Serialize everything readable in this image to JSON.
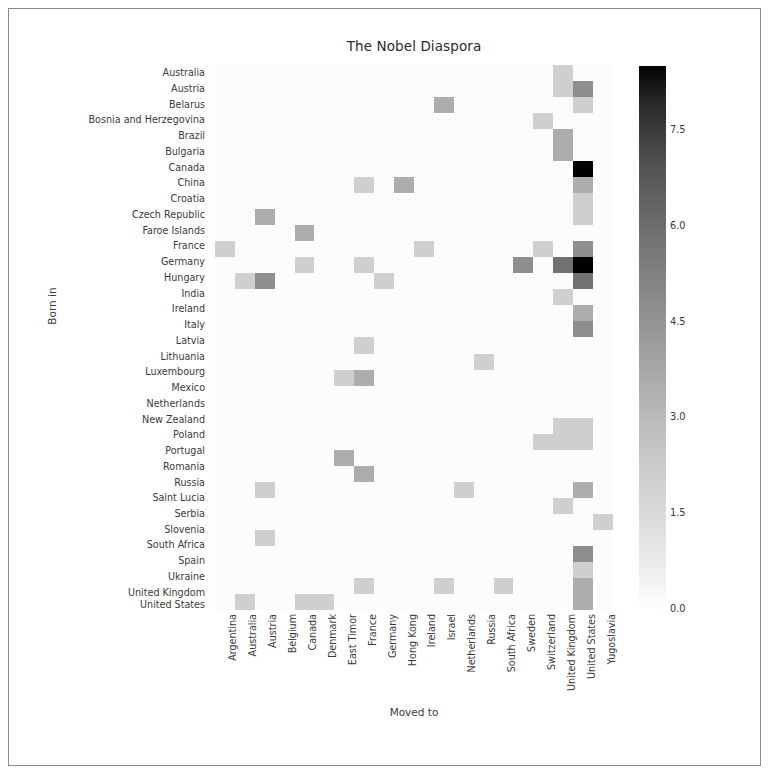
{
  "figure": {
    "title": "The Nobel Diaspora",
    "xlabel": "Moved to",
    "ylabel": "Born in"
  },
  "colorbar": {
    "ticks": [
      "0.0",
      "1.5",
      "3.0",
      "4.5",
      "6.0",
      "7.5"
    ],
    "tick_values": [
      0.0,
      1.5,
      3.0,
      4.5,
      6.0,
      7.5
    ],
    "vmin": 0,
    "vmax": 8.5,
    "low_color": "#ffffff",
    "high_color": "#000000"
  },
  "chart_data": {
    "type": "heatmap",
    "title": "The Nobel Diaspora",
    "xlabel": "Moved to",
    "ylabel": "Born in",
    "grid": false,
    "legend_position": "right",
    "colormap": "Greys",
    "zlim": [
      0,
      8.5
    ],
    "x_categories": [
      "Argentina",
      "Australia",
      "Austria",
      "Belgium",
      "Canada",
      "Denmark",
      "East Timor",
      "France",
      "Germany",
      "Hong Kong",
      "Ireland",
      "Israel",
      "Netherlands",
      "Russia",
      "South Africa",
      "Sweden",
      "Switzerland",
      "United Kingdom",
      "United States",
      "Yugoslavia"
    ],
    "y_categories": [
      "Australia",
      "Austria",
      "Belarus",
      "Bosnia and Herzegovina",
      "Brazil",
      "Bulgaria",
      "Canada",
      "China",
      "Croatia",
      "Czech Republic",
      "Faroe Islands",
      "France",
      "Germany",
      "Hungary",
      "India",
      "Ireland",
      "Italy",
      "Latvia",
      "Lithuania",
      "Luxembourg",
      "Mexico",
      "Netherlands",
      "New Zealand",
      "Poland",
      "Portugal",
      "Romania",
      "Russia",
      "Saint Lucia",
      "Serbia",
      "Slovenia",
      "South Africa",
      "Spain",
      "Ukraine",
      "United Kingdom",
      "United States"
    ],
    "values": [
      [
        0,
        0,
        0,
        0,
        0,
        0,
        0,
        0,
        0,
        0,
        0,
        0,
        0,
        0,
        0,
        0,
        0,
        1,
        0,
        0
      ],
      [
        0,
        0,
        0,
        0,
        0,
        0,
        0,
        0,
        0,
        0,
        0,
        0,
        0,
        0,
        0,
        0,
        0,
        1,
        3,
        0
      ],
      [
        0,
        0,
        0,
        0,
        0,
        0,
        0,
        0,
        0,
        0,
        0,
        2,
        0,
        0,
        0,
        0,
        0,
        0,
        1,
        0
      ],
      [
        0,
        0,
        0,
        0,
        0,
        0,
        0,
        0,
        0,
        0,
        0,
        0,
        0,
        0,
        0,
        0,
        1,
        0,
        0,
        0
      ],
      [
        0,
        0,
        0,
        0,
        0,
        0,
        0,
        0,
        0,
        0,
        0,
        0,
        0,
        0,
        0,
        0,
        0,
        2,
        0,
        0
      ],
      [
        0,
        0,
        0,
        0,
        0,
        0,
        0,
        0,
        0,
        0,
        0,
        0,
        0,
        0,
        0,
        0,
        0,
        2,
        0,
        0
      ],
      [
        0,
        0,
        0,
        0,
        0,
        0,
        0,
        0,
        0,
        0,
        0,
        0,
        0,
        0,
        0,
        0,
        0,
        0,
        8.5,
        0
      ],
      [
        0,
        0,
        0,
        0,
        0,
        0,
        0,
        1,
        0,
        2,
        0,
        0,
        0,
        0,
        0,
        0,
        0,
        0,
        2,
        0
      ],
      [
        0,
        0,
        0,
        0,
        0,
        0,
        0,
        0,
        0,
        0,
        0,
        0,
        0,
        0,
        0,
        0,
        0,
        0,
        1,
        0
      ],
      [
        0,
        0,
        2,
        0,
        0,
        0,
        0,
        0,
        0,
        0,
        0,
        0,
        0,
        0,
        0,
        0,
        0,
        0,
        1,
        0
      ],
      [
        0,
        0,
        0,
        0,
        2,
        0,
        0,
        0,
        0,
        0,
        0,
        0,
        0,
        0,
        0,
        0,
        0,
        0,
        0,
        0
      ],
      [
        1,
        0,
        0,
        0,
        0,
        0,
        0,
        0,
        0,
        0,
        1,
        0,
        0,
        0,
        0,
        0,
        1,
        0,
        3,
        0
      ],
      [
        0,
        0,
        0,
        0,
        1,
        0,
        0,
        1,
        0,
        0,
        0,
        0,
        0,
        0,
        0,
        3,
        0,
        4,
        8.5,
        0
      ],
      [
        0,
        1,
        3,
        0,
        0,
        0,
        0,
        0,
        1,
        0,
        0,
        0,
        0,
        0,
        0,
        0,
        0,
        0,
        4,
        0
      ],
      [
        0,
        0,
        0,
        0,
        0,
        0,
        0,
        0,
        0,
        0,
        0,
        0,
        0,
        0,
        0,
        0,
        0,
        1,
        0,
        0
      ],
      [
        0,
        0,
        0,
        0,
        0,
        0,
        0,
        0,
        0,
        0,
        0,
        0,
        0,
        0,
        0,
        0,
        0,
        0,
        2,
        0
      ],
      [
        0,
        0,
        0,
        0,
        0,
        0,
        0,
        0,
        0,
        0,
        0,
        0,
        0,
        0,
        0,
        0,
        0,
        0,
        3,
        0
      ],
      [
        0,
        0,
        0,
        0,
        0,
        0,
        0,
        1,
        0,
        0,
        0,
        0,
        0,
        0,
        0,
        0,
        0,
        0,
        0,
        0
      ],
      [
        0,
        0,
        0,
        0,
        0,
        0,
        0,
        0,
        0,
        0,
        0,
        0,
        0,
        1,
        0,
        0,
        0,
        0,
        0,
        0
      ],
      [
        0,
        0,
        0,
        0,
        0,
        0,
        1,
        2,
        0,
        0,
        0,
        0,
        0,
        0,
        0,
        0,
        0,
        0,
        0,
        0
      ],
      [
        0,
        0,
        0,
        0,
        0,
        0,
        0,
        0,
        0,
        0,
        0,
        0,
        0,
        0,
        0,
        0,
        0,
        0,
        0,
        0
      ],
      [
        0,
        0,
        0,
        0,
        0,
        0,
        0,
        0,
        0,
        0,
        0,
        0,
        0,
        0,
        0,
        0,
        0,
        0,
        0,
        0
      ],
      [
        0,
        0,
        0,
        0,
        0,
        0,
        0,
        0,
        0,
        0,
        0,
        0,
        0,
        0,
        0,
        0,
        0,
        1,
        1,
        0
      ],
      [
        0,
        0,
        0,
        0,
        0,
        0,
        0,
        0,
        0,
        0,
        0,
        0,
        0,
        0,
        0,
        0,
        1,
        1,
        1,
        0
      ],
      [
        0,
        0,
        0,
        0,
        0,
        0,
        2,
        0,
        0,
        0,
        0,
        0,
        0,
        0,
        0,
        0,
        0,
        0,
        0,
        0
      ],
      [
        0,
        0,
        0,
        0,
        0,
        0,
        0,
        2,
        0,
        0,
        0,
        0,
        0,
        0,
        0,
        0,
        0,
        0,
        0,
        0
      ],
      [
        0,
        0,
        1,
        0,
        0,
        0,
        0,
        0,
        0,
        0,
        0,
        0,
        1,
        0,
        0,
        0,
        0,
        0,
        2,
        0
      ],
      [
        0,
        0,
        0,
        0,
        0,
        0,
        0,
        0,
        0,
        0,
        0,
        0,
        0,
        0,
        0,
        0,
        0,
        1,
        0,
        0
      ],
      [
        0,
        0,
        0,
        0,
        0,
        0,
        0,
        0,
        0,
        0,
        0,
        0,
        0,
        0,
        0,
        0,
        0,
        0,
        0,
        1
      ],
      [
        0,
        0,
        1,
        0,
        0,
        0,
        0,
        0,
        0,
        0,
        0,
        0,
        0,
        0,
        0,
        0,
        0,
        0,
        0,
        0
      ],
      [
        0,
        0,
        0,
        0,
        0,
        0,
        0,
        0,
        0,
        0,
        0,
        0,
        0,
        0,
        0,
        0,
        0,
        0,
        3,
        0
      ],
      [
        0,
        0,
        0,
        0,
        0,
        0,
        0,
        0,
        0,
        0,
        0,
        0,
        0,
        0,
        0,
        0,
        0,
        0,
        1,
        0
      ],
      [
        0,
        0,
        0,
        0,
        0,
        0,
        0,
        1,
        0,
        0,
        0,
        1,
        0,
        0,
        1,
        0,
        0,
        0,
        2,
        0
      ],
      [
        0,
        1,
        0,
        0,
        1,
        1,
        0,
        0,
        0,
        0,
        0,
        0,
        0,
        0,
        0,
        0,
        0,
        0,
        2,
        0
      ],
      [
        0,
        0,
        0,
        0,
        0,
        0,
        0,
        0,
        0,
        0,
        0,
        0,
        0,
        0,
        0,
        0,
        0,
        1,
        0,
        0
      ]
    ]
  }
}
